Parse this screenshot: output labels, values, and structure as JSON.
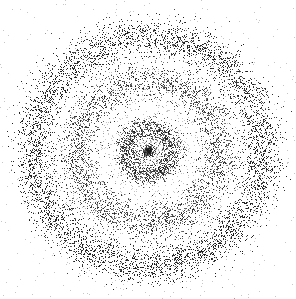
{
  "image": {
    "width": 296,
    "height": 299,
    "background": "#ffffff",
    "dot_color": "#1a1a1a",
    "description": "stippled concentric rings"
  },
  "rings": {
    "center": [
      148,
      151
    ],
    "components": [
      {
        "name": "core",
        "radius": 0,
        "sigma": 4,
        "count": 260
      },
      {
        "name": "inner-ring",
        "radius": 24,
        "sigma": 6,
        "count": 1400
      },
      {
        "name": "middle-ring",
        "radius": 72,
        "sigma": 10,
        "count": 3200
      },
      {
        "name": "outer-ring",
        "radius": 115,
        "sigma": 10,
        "count": 9000
      },
      {
        "name": "diffuse-background",
        "radius": 80,
        "sigma": 70,
        "count": 2200
      }
    ]
  }
}
